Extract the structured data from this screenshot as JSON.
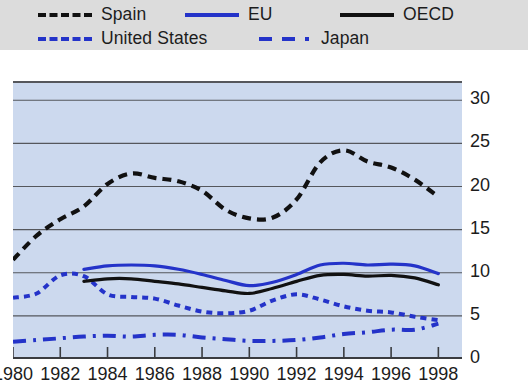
{
  "legend": {
    "entries": [
      {
        "label": "Spain",
        "style": "dashed",
        "color": "#111111",
        "icon": "line-dashed-black-icon"
      },
      {
        "label": "EU",
        "style": "solid",
        "color": "#2433c9",
        "icon": "line-solid-blue-icon"
      },
      {
        "label": "OECD",
        "style": "solid",
        "color": "#111111",
        "icon": "line-solid-black-icon"
      },
      {
        "label": "United States",
        "style": "dotted",
        "color": "#2433c9",
        "icon": "line-dotted-blue-icon"
      },
      {
        "label": "Japan",
        "style": "dashdot",
        "color": "#2433c9",
        "icon": "line-dashdot-blue-icon"
      }
    ]
  },
  "colors": {
    "legend_background": "#dcdcdc",
    "plot_background": "#ccd9ee",
    "gridline": "#55575c",
    "axis": "#3a3c40",
    "blue_series": "#2433c9",
    "black_series": "#111111",
    "text": "#1c1c1c"
  },
  "chart_data": {
    "type": "line",
    "title": "",
    "subtitle": "",
    "xlabel": "",
    "ylabel": "",
    "xlim": [
      1980,
      1999
    ],
    "ylim": [
      0,
      32
    ],
    "grid": true,
    "grid_axis": "y",
    "legend_position": "top",
    "y_axis_side": "right",
    "xticks": [
      1980,
      1982,
      1984,
      1986,
      1988,
      1990,
      1992,
      1994,
      1996,
      1998
    ],
    "xtick_labels": [
      "1980",
      "1982",
      "1984",
      "1986",
      "1988",
      "1990",
      "1992",
      "1994",
      "1996",
      "1998"
    ],
    "yticks": [
      0,
      5,
      10,
      15,
      20,
      25,
      30
    ],
    "ytick_labels": [
      "0",
      "5",
      "10",
      "15",
      "20",
      "25",
      "30"
    ],
    "series": [
      {
        "name": "Spain",
        "color": "#111111",
        "style": "dashed",
        "x": [
          1980,
          1981,
          1982,
          1983,
          1984,
          1985,
          1986,
          1987,
          1988,
          1989,
          1990,
          1991,
          1992,
          1993,
          1994,
          1995,
          1996,
          1997,
          1998
        ],
        "values": [
          11.5,
          14.3,
          16.2,
          17.7,
          20.3,
          21.5,
          21.0,
          20.6,
          19.5,
          17.3,
          16.3,
          16.4,
          18.5,
          22.8,
          24.2,
          22.9,
          22.2,
          20.8,
          18.8
        ]
      },
      {
        "name": "EU",
        "color": "#2433c9",
        "style": "solid",
        "x": [
          1983,
          1984,
          1985,
          1986,
          1987,
          1988,
          1989,
          1990,
          1991,
          1992,
          1993,
          1994,
          1995,
          1996,
          1997,
          1998
        ],
        "values": [
          10.4,
          10.8,
          10.9,
          10.8,
          10.4,
          9.8,
          9.1,
          8.5,
          8.9,
          9.8,
          10.9,
          11.1,
          10.9,
          11.0,
          10.8,
          9.9
        ]
      },
      {
        "name": "OECD",
        "color": "#111111",
        "style": "solid",
        "x": [
          1983,
          1984,
          1985,
          1986,
          1987,
          1988,
          1989,
          1990,
          1991,
          1992,
          1993,
          1994,
          1995,
          1996,
          1997,
          1998
        ],
        "values": [
          9.0,
          9.3,
          9.3,
          9.0,
          8.7,
          8.3,
          7.9,
          7.6,
          8.2,
          9.0,
          9.7,
          9.8,
          9.6,
          9.7,
          9.4,
          8.6
        ]
      },
      {
        "name": "United States",
        "color": "#2433c9",
        "style": "dotted",
        "x": [
          1980,
          1981,
          1982,
          1983,
          1984,
          1985,
          1986,
          1987,
          1988,
          1989,
          1990,
          1991,
          1992,
          1993,
          1994,
          1995,
          1996,
          1997,
          1998
        ],
        "values": [
          7.1,
          7.6,
          9.7,
          9.6,
          7.5,
          7.2,
          7.0,
          6.2,
          5.5,
          5.3,
          5.6,
          6.8,
          7.5,
          6.9,
          6.1,
          5.6,
          5.4,
          4.9,
          4.5
        ]
      },
      {
        "name": "Japan",
        "color": "#2433c9",
        "style": "dashdot",
        "x": [
          1980,
          1981,
          1982,
          1983,
          1984,
          1985,
          1986,
          1987,
          1988,
          1989,
          1990,
          1991,
          1992,
          1993,
          1994,
          1995,
          1996,
          1997,
          1998
        ],
        "values": [
          2.0,
          2.2,
          2.4,
          2.6,
          2.7,
          2.6,
          2.8,
          2.8,
          2.5,
          2.3,
          2.1,
          2.1,
          2.2,
          2.5,
          2.9,
          3.1,
          3.4,
          3.4,
          4.1
        ]
      }
    ]
  }
}
